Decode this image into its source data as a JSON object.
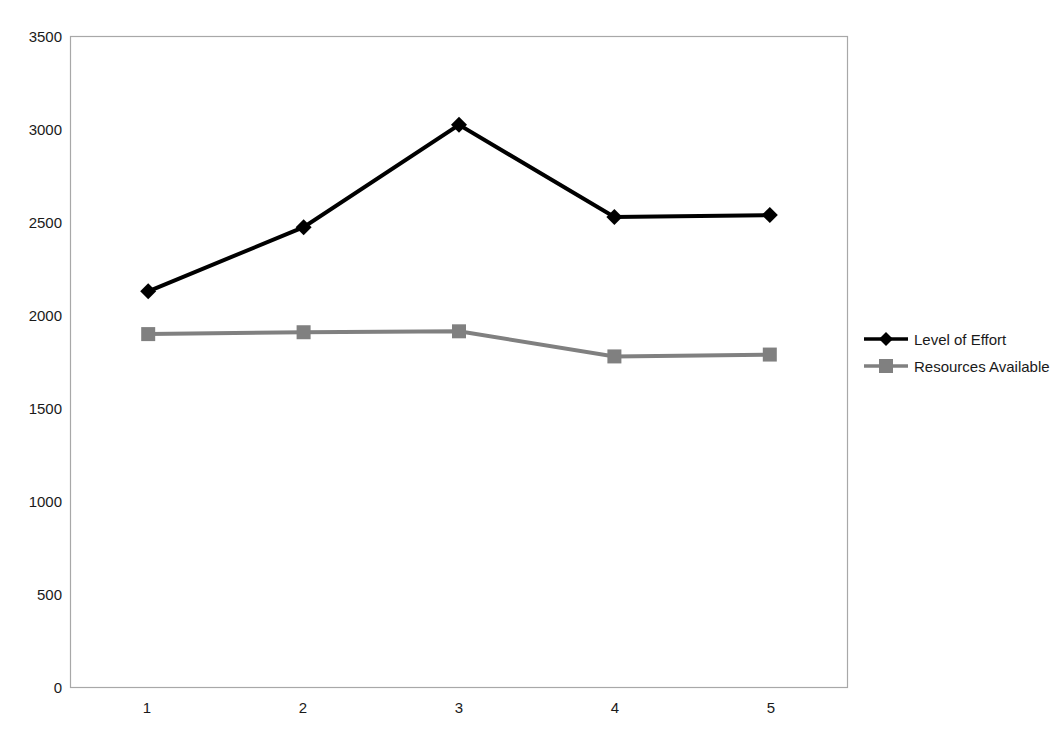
{
  "chart_data": {
    "type": "line",
    "title": "",
    "subtitle": "",
    "xlabel": "",
    "ylabel": "",
    "categories": [
      "1",
      "2",
      "3",
      "4",
      "5"
    ],
    "x": [
      1,
      2,
      3,
      4,
      5
    ],
    "series": [
      {
        "name": "Level of Effort",
        "color": "#000000",
        "marker": "diamond",
        "values": [
          2130,
          2475,
          3025,
          2530,
          2540
        ]
      },
      {
        "name": "Resources Available",
        "color": "#808080",
        "marker": "square",
        "values": [
          1900,
          1910,
          1915,
          1780,
          1790
        ]
      }
    ],
    "ylim": [
      0,
      3500
    ],
    "yticks": [
      0,
      500,
      1000,
      1500,
      2000,
      2500,
      3000,
      3500
    ],
    "ytick_labels": [
      "0",
      "500",
      "1000",
      "1500",
      "2000",
      "2500",
      "3000",
      "3500"
    ],
    "xtick_labels": [
      "1",
      "2",
      "3",
      "4",
      "5"
    ],
    "grid": false,
    "legend_position": "right",
    "legend_entries": [
      "Level of Effort",
      "Resources Available"
    ],
    "plot_border_color": "#a8a8a8",
    "background_color": "#ffffff"
  },
  "legend": {
    "items": [
      {
        "label": "Level of Effort"
      },
      {
        "label": "Resources Available"
      }
    ]
  },
  "axes": {
    "y": {
      "labels": [
        "3500",
        "3000",
        "2500",
        "2000",
        "1500",
        "1000",
        "500",
        "0"
      ]
    },
    "x": {
      "labels": [
        "1",
        "2",
        "3",
        "4",
        "5"
      ]
    }
  }
}
